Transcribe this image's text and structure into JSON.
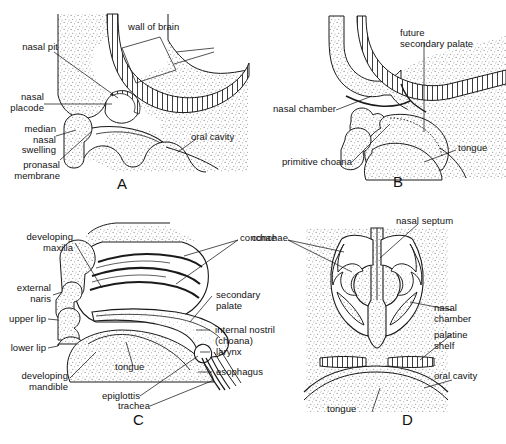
{
  "figure": {
    "background_color": "#ffffff",
    "ink_color": "#1a1a1a",
    "stipple_color": "#8a8a8a",
    "credit": ""
  },
  "panels": [
    {
      "id": "A",
      "letter": "A",
      "labels": [
        {
          "key": "nasal_pit",
          "text": "nasal pit"
        },
        {
          "key": "wall_of_brain",
          "text": "wall of brain"
        },
        {
          "key": "nasal_placode",
          "text": "nasal\nplacode"
        },
        {
          "key": "median_nasal_swelling",
          "text": "median\nnasal\nswelling"
        },
        {
          "key": "pronasal_membrane",
          "text": "pronasal\nmembrane"
        },
        {
          "key": "oral_cavity",
          "text": "oral cavity"
        }
      ]
    },
    {
      "id": "B",
      "letter": "B",
      "labels": [
        {
          "key": "future_secondary_palate",
          "text": "future\nsecondary palate"
        },
        {
          "key": "nasal_chamber",
          "text": "nasal chamber"
        },
        {
          "key": "primitive_choana",
          "text": "primitive choana"
        },
        {
          "key": "tongue",
          "text": "tongue"
        }
      ]
    },
    {
      "id": "C",
      "letter": "C",
      "labels": [
        {
          "key": "developing_maxilla",
          "text": "developing\nmaxilla"
        },
        {
          "key": "external_naris",
          "text": "external\nnaris"
        },
        {
          "key": "upper_lip",
          "text": "upper lip"
        },
        {
          "key": "lower_lip",
          "text": "lower lip"
        },
        {
          "key": "developing_mandible",
          "text": "developing\nmandible"
        },
        {
          "key": "tongue",
          "text": "tongue"
        },
        {
          "key": "epiglottis",
          "text": "epiglottis"
        },
        {
          "key": "trachea",
          "text": "trachea"
        },
        {
          "key": "conchae",
          "text": "conchae"
        },
        {
          "key": "secondary_palate",
          "text": "secondary\npalate"
        },
        {
          "key": "internal_nostril",
          "text": "internal nostril\n(choana)"
        },
        {
          "key": "larynx",
          "text": "larynx"
        },
        {
          "key": "esophagus",
          "text": "esophagus"
        }
      ]
    },
    {
      "id": "D",
      "letter": "D",
      "labels": [
        {
          "key": "nasal_septum",
          "text": "nasal septum"
        },
        {
          "key": "conchae",
          "text": "conchae"
        },
        {
          "key": "nasal_chamber",
          "text": "nasal\nchamber"
        },
        {
          "key": "palatine_shelf",
          "text": "palatine\nshelf"
        },
        {
          "key": "oral_cavity",
          "text": "oral cavity"
        },
        {
          "key": "tongue",
          "text": "tongue"
        }
      ]
    }
  ]
}
